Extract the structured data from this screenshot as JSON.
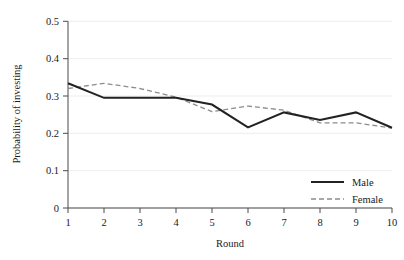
{
  "chart_data": {
    "type": "line",
    "title": "",
    "subtitle": "",
    "xlabel": "Round",
    "ylabel": "Probability of investing",
    "x": [
      1,
      2,
      3,
      4,
      5,
      6,
      7,
      8,
      9,
      10
    ],
    "categories": [
      "1",
      "2",
      "3",
      "4",
      "5",
      "6",
      "7",
      "8",
      "9",
      "10"
    ],
    "series": [
      {
        "name": "Male",
        "style": "solid",
        "color": "#222222",
        "values": [
          0.334,
          0.295,
          0.295,
          0.295,
          0.277,
          0.216,
          0.256,
          0.236,
          0.256,
          0.215
        ]
      },
      {
        "name": "Female",
        "style": "dashed",
        "color": "#8c8c8c",
        "values": [
          0.32,
          0.334,
          0.32,
          0.297,
          0.258,
          0.273,
          0.262,
          0.228,
          0.228,
          0.214
        ]
      }
    ],
    "xlim": [
      1,
      10
    ],
    "ylim": [
      0,
      0.5
    ],
    "ytick_labels": [
      "0.5",
      "0.4",
      "0.3",
      "0.2",
      "0.1",
      "0"
    ],
    "ytick_values": [
      0.5,
      0.4,
      0.3,
      0.2,
      0.1,
      0
    ],
    "xtick_labels": [
      "1",
      "2",
      "3",
      "4",
      "5",
      "6",
      "7",
      "8",
      "9",
      "10"
    ],
    "grid": "horizontal",
    "legend_position": "bottom-right",
    "legend": [
      {
        "label": "Male",
        "style": "solid"
      },
      {
        "label": "Female",
        "style": "dashed"
      }
    ]
  },
  "axes": {
    "y_title": "Probability of investing",
    "x_title": "Round",
    "y_ticks": [
      {
        "label": "0.5"
      },
      {
        "label": "0.4"
      },
      {
        "label": "0.3"
      },
      {
        "label": "0.2"
      },
      {
        "label": "0.1"
      },
      {
        "label": "0"
      }
    ],
    "x_ticks": [
      {
        "label": "1"
      },
      {
        "label": "2"
      },
      {
        "label": "3"
      },
      {
        "label": "4"
      },
      {
        "label": "5"
      },
      {
        "label": "6"
      },
      {
        "label": "7"
      },
      {
        "label": "8"
      },
      {
        "label": "9"
      },
      {
        "label": "10"
      }
    ]
  },
  "legend": {
    "male_label": "Male",
    "female_label": "Female"
  },
  "colors": {
    "male_line": "#222222",
    "female_line": "#8c8c8c",
    "grid": "#e8e8e8",
    "axis": "#4a4a4a",
    "text": "#1a1a1a",
    "background": "#ffffff"
  }
}
